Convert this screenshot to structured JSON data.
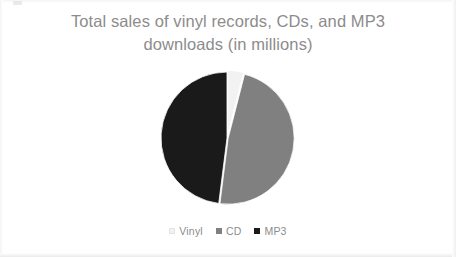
{
  "chart_data": {
    "type": "pie",
    "title": "Total sales of vinyl records, CDs, and MP3\ndownloads (in millions)",
    "title_line1": "Total sales of vinyl records, CDs, and MP3",
    "title_line2": "downloads (in millions)",
    "categories": [
      "Vinyl",
      "CD",
      "MP3"
    ],
    "values": [
      4,
      48,
      48
    ],
    "percentages": [
      4,
      48,
      48
    ],
    "colors": [
      "#f2f2f2",
      "#808080",
      "#1a1a1a"
    ],
    "xlabel": "",
    "ylabel": "",
    "units": "millions",
    "legend_position": "bottom",
    "grid": false,
    "start_angle_deg": 0,
    "slices": [
      {
        "label": "Vinyl",
        "value": 4,
        "percent": 4,
        "color": "#f2f2f2",
        "start_deg": 0,
        "end_deg": 14.4
      },
      {
        "label": "CD",
        "value": 48,
        "percent": 48,
        "color": "#808080",
        "start_deg": 14.4,
        "end_deg": 187.2
      },
      {
        "label": "MP3",
        "value": 48,
        "percent": 48,
        "color": "#1a1a1a",
        "start_deg": 187.2,
        "end_deg": 360
      }
    ]
  },
  "legend": {
    "items": [
      {
        "label": "Vinyl",
        "color": "#f2f2f2"
      },
      {
        "label": "CD",
        "color": "#808080"
      },
      {
        "label": "MP3",
        "color": "#1a1a1a"
      }
    ]
  },
  "style": {
    "title_color": "#8c8c8c",
    "legend_text_color": "#8c8c8c",
    "background": "#ffffff"
  }
}
